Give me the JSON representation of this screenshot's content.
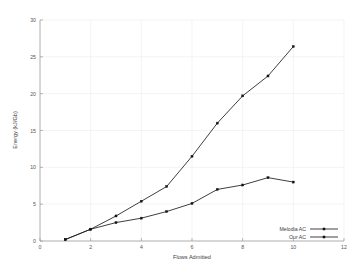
{
  "chart_data": {
    "type": "line",
    "title": "",
    "xlabel": "Flows Admitted",
    "ylabel": "Energy (kJ/Gb)",
    "xlim": [
      0,
      12
    ],
    "ylim": [
      0,
      30
    ],
    "xticks": [
      0,
      2,
      4,
      6,
      8,
      10,
      12
    ],
    "yticks": [
      0,
      5,
      10,
      15,
      20,
      25,
      30
    ],
    "grid": true,
    "legend_position": "bottom-right",
    "marker": "filled-square",
    "x": [
      1,
      2,
      3,
      4,
      5,
      6,
      7,
      8,
      9,
      10
    ],
    "series": [
      {
        "name": "Melodia AC",
        "values": [
          0.2,
          1.6,
          3.4,
          5.4,
          7.4,
          11.5,
          16.0,
          19.7,
          22.4,
          26.4
        ],
        "color": "#1c1c1c"
      },
      {
        "name": "Our AC",
        "values": [
          0.2,
          1.6,
          2.5,
          3.1,
          4.0,
          5.1,
          7.0,
          7.6,
          8.6,
          8.0
        ],
        "color": "#1c1c1c"
      }
    ]
  },
  "axes": {
    "x_title": "Flows Admitted",
    "y_title": "Energy (kJ/Gb)",
    "x_tick_labels": [
      "0",
      "2",
      "4",
      "6",
      "8",
      "10",
      "12"
    ],
    "y_tick_labels": [
      "0",
      "5",
      "10",
      "15",
      "20",
      "25",
      "30"
    ]
  },
  "legend": {
    "entries": [
      {
        "label": "Melodia AC"
      },
      {
        "label": "Our AC"
      }
    ]
  },
  "style": {
    "background": "#ffffff",
    "grid_color": "#ededed",
    "axis_color": "#9a9a9a",
    "line_color": "#1c1c1c",
    "text_color": "#3d3d3d"
  }
}
